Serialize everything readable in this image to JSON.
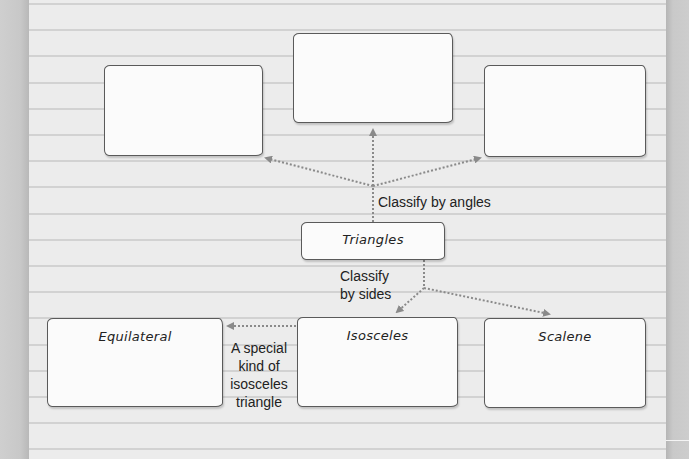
{
  "diagram": {
    "root": {
      "label": "Triangles"
    },
    "angle_branch": {
      "caption": "Classify by angles",
      "boxes": [
        {
          "id": "angle-box-left",
          "label": ""
        },
        {
          "id": "angle-box-center",
          "label": ""
        },
        {
          "id": "angle-box-right",
          "label": ""
        }
      ]
    },
    "side_branch": {
      "caption_line1": "Classify",
      "caption_line2": "by sides",
      "boxes": [
        {
          "id": "equilateral",
          "label": "Equilateral"
        },
        {
          "id": "isosceles",
          "label": "Isosceles"
        },
        {
          "id": "scalene",
          "label": "Scalene"
        }
      ]
    },
    "note": {
      "line1": "A special",
      "line2": "kind of",
      "line3": "isosceles",
      "line4": "triangle"
    },
    "colors": {
      "paper": "#ececec",
      "rule_line": "#d2d2d2",
      "box_fill": "#fbfbfb",
      "box_border": "#5a5a5a",
      "arrow": "#8a8a8a",
      "margin": "#c9c9c9"
    }
  }
}
